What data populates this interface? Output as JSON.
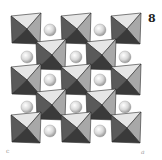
{
  "figure": {
    "panel_label": "8",
    "axis_label_left": "c",
    "axis_label_right": "a"
  },
  "colors": {
    "background": "#ffffff",
    "face_light": "#e6e6e6",
    "face_mid": "#a8a8a8",
    "face_dark": "#5a5a5a",
    "face_darkest": "#3a3a3a",
    "sphere_light": "#ffffff",
    "sphere_dark": "#9a9a9a"
  },
  "octahedra": [
    {
      "cx": 26,
      "cy": 29,
      "r": 15
    },
    {
      "cx": 76,
      "cy": 29,
      "r": 15
    },
    {
      "cx": 126,
      "cy": 29,
      "r": 15
    },
    {
      "cx": 51,
      "cy": 55,
      "r": 15
    },
    {
      "cx": 101,
      "cy": 55,
      "r": 15
    },
    {
      "cx": 26,
      "cy": 80,
      "r": 15
    },
    {
      "cx": 76,
      "cy": 80,
      "r": 15
    },
    {
      "cx": 126,
      "cy": 80,
      "r": 15
    },
    {
      "cx": 51,
      "cy": 105,
      "r": 15
    },
    {
      "cx": 101,
      "cy": 105,
      "r": 15
    },
    {
      "cx": 26,
      "cy": 128,
      "r": 15
    },
    {
      "cx": 76,
      "cy": 128,
      "r": 15
    },
    {
      "cx": 126,
      "cy": 128,
      "r": 15
    }
  ],
  "spheres": [
    {
      "cx": 50,
      "cy": 30,
      "r": 6
    },
    {
      "cx": 100,
      "cy": 30,
      "r": 6
    },
    {
      "cx": 27,
      "cy": 57,
      "r": 6
    },
    {
      "cx": 76,
      "cy": 57,
      "r": 6
    },
    {
      "cx": 125,
      "cy": 57,
      "r": 6
    },
    {
      "cx": 50,
      "cy": 80,
      "r": 6
    },
    {
      "cx": 100,
      "cy": 80,
      "r": 6
    },
    {
      "cx": 27,
      "cy": 107,
      "r": 6
    },
    {
      "cx": 76,
      "cy": 107,
      "r": 6
    },
    {
      "cx": 125,
      "cy": 107,
      "r": 6
    },
    {
      "cx": 50,
      "cy": 131,
      "r": 6
    },
    {
      "cx": 100,
      "cy": 131,
      "r": 6
    }
  ]
}
